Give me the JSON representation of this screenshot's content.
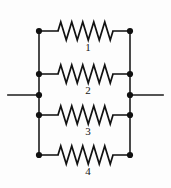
{
  "diagram": {
    "type": "circuit-schematic",
    "colors": {
      "background": "#fdfdfd",
      "wire": "#1b1b1b",
      "node": "#101010",
      "label": "#141414"
    },
    "geometry": {
      "width": 171,
      "height": 188,
      "left_rail_x": 39,
      "right_rail_x": 130,
      "terminal_left_x": 8,
      "terminal_right_x": 163,
      "terminal_y": 95,
      "branch_y": [
        31,
        74,
        115,
        155
      ]
    },
    "branches": [
      {
        "id": "branch-1",
        "label": "1",
        "label_x": 88,
        "label_y": 51,
        "y": 31,
        "lead_left_end": 58,
        "lead_right_start": 113,
        "peaks": 5,
        "amplitude": 9
      },
      {
        "id": "branch-2",
        "label": "2",
        "label_x": 88,
        "label_y": 94,
        "y": 74,
        "lead_left_end": 58,
        "lead_right_start": 113,
        "peaks": 5,
        "amplitude": 9
      },
      {
        "id": "branch-3",
        "label": "3",
        "label_x": 88,
        "label_y": 135,
        "y": 115,
        "lead_left_end": 58,
        "lead_right_start": 113,
        "peaks": 5,
        "amplitude": 9
      },
      {
        "id": "branch-4",
        "label": "4",
        "label_x": 88,
        "label_y": 175,
        "y": 155,
        "lead_left_end": 58,
        "lead_right_start": 113,
        "peaks": 5,
        "amplitude": 9
      }
    ],
    "nodes": [
      {
        "name": "node-left-1",
        "x": 39,
        "y": 31,
        "r": 3.1
      },
      {
        "name": "node-left-2",
        "x": 39,
        "y": 74,
        "r": 3.1
      },
      {
        "name": "node-left-terminal",
        "x": 39,
        "y": 95,
        "r": 3.1
      },
      {
        "name": "node-left-3",
        "x": 39,
        "y": 115,
        "r": 3.1
      },
      {
        "name": "node-left-4",
        "x": 39,
        "y": 155,
        "r": 3.1
      },
      {
        "name": "node-right-1",
        "x": 130,
        "y": 31,
        "r": 3.1
      },
      {
        "name": "node-right-2",
        "x": 130,
        "y": 74,
        "r": 3.1
      },
      {
        "name": "node-right-terminal",
        "x": 130,
        "y": 95,
        "r": 3.1
      },
      {
        "name": "node-right-3",
        "x": 130,
        "y": 115,
        "r": 3.1
      },
      {
        "name": "node-right-4",
        "x": 130,
        "y": 155,
        "r": 3.1
      }
    ],
    "terminals": [
      {
        "name": "terminal-lead-left",
        "x1": 8,
        "y1": 95,
        "x2": 39,
        "y2": 95
      },
      {
        "name": "terminal-lead-right",
        "x1": 130,
        "y1": 95,
        "x2": 163,
        "y2": 95
      }
    ]
  }
}
